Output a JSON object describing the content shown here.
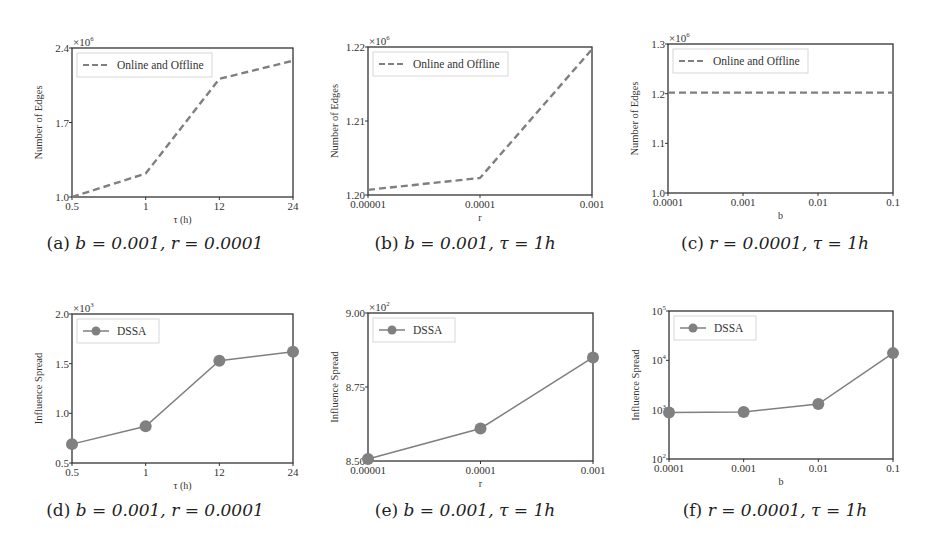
{
  "figure": {
    "panels": [
      {
        "id": "a",
        "caption": {
          "label": "(a)",
          "text": "b = 0.001, r = 0.0001"
        },
        "frame": {
          "x": 72,
          "y": 48,
          "w": 221,
          "h": 149
        },
        "offset": {
          "left": 0,
          "top": 0
        }
      },
      {
        "id": "b",
        "caption": {
          "label": "(b)",
          "text": "b = 0.001, τ = 1h"
        },
        "frame": {
          "x": 58,
          "y": 47,
          "w": 224,
          "h": 148
        },
        "offset": {
          "left": 310,
          "top": 0
        }
      },
      {
        "id": "c",
        "caption": {
          "label": "(c)",
          "text": "r = 0.0001, τ = 1h"
        },
        "frame": {
          "x": 48,
          "y": 44,
          "w": 225,
          "h": 149
        },
        "offset": {
          "left": 620,
          "top": 0
        }
      },
      {
        "id": "d",
        "caption": {
          "label": "(d)",
          "text": "b = 0.001, r = 0.0001"
        },
        "frame": {
          "x": 72,
          "y": 44,
          "w": 221,
          "h": 149
        },
        "offset": {
          "left": 0,
          "top": 270
        }
      },
      {
        "id": "e",
        "caption": {
          "label": "(e)",
          "text": "b = 0.001, τ = 1h"
        },
        "frame": {
          "x": 58,
          "y": 43,
          "w": 225,
          "h": 148
        },
        "offset": {
          "left": 310,
          "top": 270
        }
      },
      {
        "id": "f",
        "caption": {
          "label": "(f)",
          "text": "r = 0.0001, τ = 1h"
        },
        "frame": {
          "x": 49,
          "y": 41,
          "w": 224,
          "h": 148
        },
        "offset": {
          "left": 620,
          "top": 270
        }
      }
    ]
  },
  "colors": {
    "line": "#7f7f7f",
    "marker": "#808080",
    "axis": "#333333",
    "legend_border": "#cccccc"
  },
  "chart_data": [
    {
      "id": "a",
      "type": "line",
      "title": "",
      "xlabel": "τ (h)",
      "ylabel": "Number of Edges",
      "y_multiplier": "×10^6",
      "categories": [
        "0.5",
        "1",
        "12",
        "24"
      ],
      "series": [
        {
          "name": "Online and Offline",
          "style": "dashed",
          "marker": "none",
          "values": [
            1.0,
            1.22,
            2.11,
            2.28
          ]
        }
      ],
      "ylim": [
        1.0,
        2.4
      ],
      "yticks": [
        "1.0",
        "1.7",
        "2.4"
      ],
      "ytick_values": [
        1.0,
        1.7,
        2.4
      ],
      "yscale": "linear",
      "grid": false,
      "legend_position": "upper left"
    },
    {
      "id": "b",
      "type": "line",
      "title": "",
      "xlabel": "r",
      "ylabel": "Number of Edges",
      "y_multiplier": "×10^6",
      "categories": [
        "0.00001",
        "0.0001",
        "0.001"
      ],
      "series": [
        {
          "name": "Online and Offline",
          "style": "dashed",
          "marker": "none",
          "values": [
            1.2007,
            1.2023,
            1.2197
          ]
        }
      ],
      "ylim": [
        1.2,
        1.22
      ],
      "yticks": [
        "1.20",
        "1.21",
        "1.22"
      ],
      "ytick_values": [
        1.2,
        1.21,
        1.22
      ],
      "yscale": "linear",
      "grid": false,
      "legend_position": "upper left"
    },
    {
      "id": "c",
      "type": "line",
      "title": "",
      "xlabel": "b",
      "ylabel": "Number of Edges",
      "y_multiplier": "×10^6",
      "categories": [
        "0.0001",
        "0.001",
        "0.01",
        "0.1"
      ],
      "series": [
        {
          "name": "Online and Offline",
          "style": "dashed",
          "marker": "none",
          "values": [
            1.202,
            1.202,
            1.202,
            1.202
          ]
        }
      ],
      "ylim": [
        1.0,
        1.3
      ],
      "yticks": [
        "1.0",
        "1.1",
        "1.2",
        "1.3"
      ],
      "ytick_values": [
        1.0,
        1.1,
        1.2,
        1.3
      ],
      "yscale": "linear",
      "grid": false,
      "legend_position": "upper left"
    },
    {
      "id": "d",
      "type": "line",
      "title": "",
      "xlabel": "τ (h)",
      "ylabel": "Influence Spread",
      "y_multiplier": "×10^3",
      "categories": [
        "0.5",
        "1",
        "12",
        "24"
      ],
      "series": [
        {
          "name": "DSSA",
          "style": "solid",
          "marker": "circle",
          "values": [
            0.69,
            0.87,
            1.53,
            1.62
          ]
        }
      ],
      "ylim": [
        0.5,
        2.0
      ],
      "yticks": [
        "0.5",
        "1.0",
        "1.5",
        "2.0"
      ],
      "ytick_values": [
        0.5,
        1.0,
        1.5,
        2.0
      ],
      "yscale": "linear",
      "grid": false,
      "legend_position": "upper left"
    },
    {
      "id": "e",
      "type": "line",
      "title": "",
      "xlabel": "r",
      "ylabel": "Influence Spread",
      "y_multiplier": "×10^2",
      "categories": [
        "0.00001",
        "0.0001",
        "0.001"
      ],
      "series": [
        {
          "name": "DSSA",
          "style": "solid",
          "marker": "circle",
          "values": [
            8.507,
            8.61,
            8.85
          ]
        }
      ],
      "ylim": [
        8.5,
        9.0
      ],
      "yticks": [
        "8.50",
        "8.75",
        "9.00"
      ],
      "ytick_values": [
        8.5,
        8.75,
        9.0
      ],
      "yscale": "linear",
      "grid": false,
      "legend_position": "upper left"
    },
    {
      "id": "f",
      "type": "line",
      "title": "",
      "xlabel": "b",
      "ylabel": "Influence Spread",
      "y_multiplier": "",
      "categories": [
        "0.0001",
        "0.001",
        "0.01",
        "0.1"
      ],
      "series": [
        {
          "name": "DSSA",
          "style": "solid",
          "marker": "circle",
          "values": [
            880,
            900,
            1300,
            14000
          ]
        }
      ],
      "ylim": [
        100,
        100000
      ],
      "yticks": [
        "10^2",
        "10^3",
        "10^4",
        "10^5"
      ],
      "ytick_values": [
        100,
        1000,
        10000,
        100000
      ],
      "yscale": "log",
      "grid": false,
      "legend_position": "upper left"
    }
  ]
}
